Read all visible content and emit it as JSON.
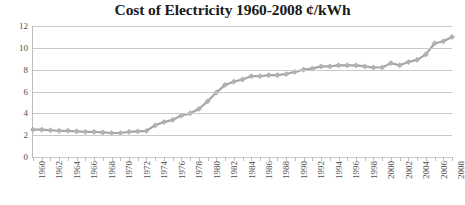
{
  "chart_data": {
    "type": "line",
    "title": "Cost of Electricity 1960-2008 ¢/kWh",
    "xlabel": "",
    "ylabel": "",
    "ylim": [
      0,
      12
    ],
    "yticks": [
      0,
      2,
      4,
      6,
      8,
      10,
      12
    ],
    "xlim": [
      1960,
      2008
    ],
    "grid": true,
    "legend": "none",
    "marker": "diamond",
    "line_color": "#a6a6a6",
    "marker_color": "#b3b3b3",
    "gridline_color": "#c9c9c9",
    "axis_color": "#bdbdbd",
    "title_color": "#1a1a1a",
    "tick_label_color": "#4d4d4d",
    "background_color": "#ffffff",
    "xtick_labels": [
      "1960",
      "1962",
      "1964",
      "1966",
      "1968",
      "1970",
      "1972",
      "1974",
      "1976",
      "1978",
      "1980",
      "1982",
      "1984",
      "1986",
      "1988",
      "1990",
      "1992",
      "1994",
      "1996",
      "1998",
      "2000",
      "2002",
      "2004",
      "2006",
      "2008"
    ],
    "x": [
      1960,
      1961,
      1962,
      1963,
      1964,
      1965,
      1966,
      1967,
      1968,
      1969,
      1970,
      1971,
      1972,
      1973,
      1974,
      1975,
      1976,
      1977,
      1978,
      1979,
      1980,
      1981,
      1982,
      1983,
      1984,
      1985,
      1986,
      1987,
      1988,
      1989,
      1990,
      1991,
      1992,
      1993,
      1994,
      1995,
      1996,
      1997,
      1998,
      1999,
      2000,
      2001,
      2002,
      2003,
      2004,
      2005,
      2006,
      2007,
      2008
    ],
    "values": [
      2.5,
      2.5,
      2.45,
      2.4,
      2.4,
      2.35,
      2.3,
      2.3,
      2.25,
      2.2,
      2.2,
      2.3,
      2.35,
      2.4,
      2.9,
      3.2,
      3.4,
      3.8,
      4.0,
      4.4,
      5.1,
      5.9,
      6.6,
      6.9,
      7.1,
      7.4,
      7.4,
      7.5,
      7.5,
      7.6,
      7.8,
      8.0,
      8.1,
      8.3,
      8.3,
      8.4,
      8.4,
      8.4,
      8.3,
      8.2,
      8.2,
      8.6,
      8.4,
      8.7,
      8.9,
      9.4,
      10.4,
      10.6,
      11.0
    ]
  }
}
